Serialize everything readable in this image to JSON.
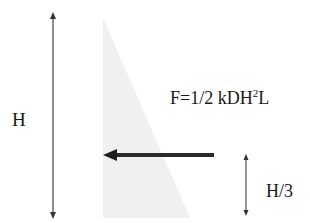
{
  "diagram": {
    "labels": {
      "height": "H",
      "force_prefix": "F=1/2 kDH",
      "force_exponent": "2",
      "force_suffix": "L",
      "force_full": "F=1/2 kDH²L",
      "application_height": "H/3"
    },
    "elements": {
      "height_dimension_arrow": {
        "x": 53,
        "y1": 13,
        "y2": 218,
        "color": "#333333"
      },
      "pressure_triangle": {
        "points": [
          [
            103,
            18
          ],
          [
            103,
            218
          ],
          [
            190,
            218
          ]
        ],
        "fill": "#f0f0f0"
      },
      "resultant_force_arrow": {
        "x_tail": 214,
        "x_head": 103,
        "y": 155,
        "color": "#2b2b2b"
      },
      "h3_dimension_arrow": {
        "x": 246,
        "y1": 155,
        "y2": 215,
        "color": "#333333"
      }
    },
    "colors": {
      "background": "#ffffff",
      "triangle_fill": "#f0f0f0",
      "stroke": "#333333",
      "force_arrow": "#2b2b2b",
      "text": "#1a1a1a"
    }
  }
}
